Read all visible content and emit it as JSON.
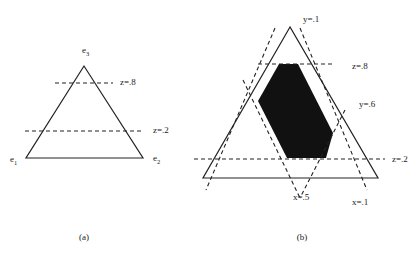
{
  "figure": {
    "panel_a": {
      "caption": "(a)",
      "vertices": [
        {
          "name": "e",
          "sub": "1"
        },
        {
          "name": "e",
          "sub": "2"
        },
        {
          "name": "e",
          "sub": "3"
        }
      ],
      "lines": [
        {
          "label": "z=.8"
        },
        {
          "label": "z=.2"
        }
      ]
    },
    "panel_b": {
      "caption": "(b)",
      "lines": [
        {
          "label": "y=.1"
        },
        {
          "label": "z=.8"
        },
        {
          "label": "y=.6"
        },
        {
          "label": "z=.2"
        },
        {
          "label": "x=.5"
        },
        {
          "label": "x=.1"
        }
      ],
      "region_color": "#111111"
    }
  }
}
